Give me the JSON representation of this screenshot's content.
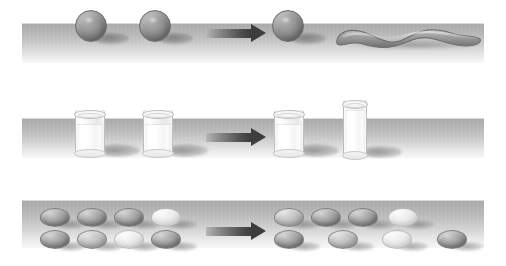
{
  "figure": {
    "background_color": "#ffffff",
    "width": 506,
    "height": 266,
    "table_color_top": "#a9a9a9",
    "table_color_bottom": "#f7f7f7",
    "arrow_color": "#3d3d3d",
    "clay_color": "#8b8b8b",
    "egg_dark_color": "#8d8d8d",
    "egg_mid_color": "#c0c0c0",
    "egg_light_color": "#e6e6e6",
    "milk_color": "#ffffff",
    "glass_outline_color": "#bdbdbd",
    "shadow_color": "#6e6e6e"
  },
  "rows": [
    {
      "id": "row-mass",
      "name": "conservation-of-mass",
      "table": {
        "x": 22,
        "y": 23,
        "w": 462,
        "h": 40
      },
      "arrow": {
        "x": 206,
        "y": 24,
        "shaft_w": 45,
        "label": "transform-arrow"
      },
      "before": {
        "label": "two-equal-clay-balls",
        "objects": [
          {
            "type": "clay-ball",
            "x": 75,
            "y": 10,
            "d": 32
          },
          {
            "type": "clay-ball",
            "x": 139,
            "y": 10,
            "d": 32
          }
        ]
      },
      "after": {
        "label": "ball-and-rolled-snake",
        "objects": [
          {
            "type": "clay-ball",
            "x": 272,
            "y": 10,
            "d": 32
          },
          {
            "type": "clay-snake",
            "x": 335,
            "y": 27,
            "w": 143,
            "h": 21
          }
        ]
      }
    },
    {
      "id": "row-liquid",
      "name": "conservation-of-liquid",
      "table": {
        "x": 22,
        "y": 118,
        "w": 462,
        "h": 40
      },
      "arrow": {
        "x": 206,
        "y": 128,
        "shaft_w": 45,
        "label": "transform-arrow"
      },
      "before": {
        "label": "two-identical-short-glasses",
        "objects": [
          {
            "type": "glass-short",
            "x": 75,
            "y": 110,
            "w": 30,
            "h": 44,
            "fill_pct": 62
          },
          {
            "type": "glass-short",
            "x": 143,
            "y": 110,
            "w": 30,
            "h": 44,
            "fill_pct": 62
          }
        ]
      },
      "after": {
        "label": "short-glass-and-tall-glass",
        "objects": [
          {
            "type": "glass-short",
            "x": 274,
            "y": 110,
            "w": 30,
            "h": 44,
            "fill_pct": 62
          },
          {
            "type": "glass-tall",
            "x": 343,
            "y": 100,
            "w": 24,
            "h": 56,
            "fill_pct": 78
          }
        ]
      }
    },
    {
      "id": "row-number",
      "name": "conservation-of-number",
      "table": {
        "x": 22,
        "y": 200,
        "w": 462,
        "h": 48
      },
      "arrow": {
        "x": 206,
        "y": 222,
        "shaft_w": 45,
        "label": "transform-arrow"
      },
      "before": {
        "label": "two-matched-rows-of-four-eggs",
        "objects": [
          {
            "type": "egg",
            "shade": "dark",
            "x": 40,
            "y": 208,
            "w": 30,
            "h": 19
          },
          {
            "type": "egg",
            "shade": "dark",
            "x": 77,
            "y": 208,
            "w": 30,
            "h": 19
          },
          {
            "type": "egg",
            "shade": "dark",
            "x": 114,
            "y": 208,
            "w": 30,
            "h": 19
          },
          {
            "type": "egg",
            "shade": "light",
            "x": 151,
            "y": 208,
            "w": 30,
            "h": 19
          },
          {
            "type": "egg",
            "shade": "dark",
            "x": 40,
            "y": 230,
            "w": 30,
            "h": 19
          },
          {
            "type": "egg",
            "shade": "mid",
            "x": 77,
            "y": 230,
            "w": 30,
            "h": 19
          },
          {
            "type": "egg",
            "shade": "light",
            "x": 114,
            "y": 230,
            "w": 30,
            "h": 19
          },
          {
            "type": "egg",
            "shade": "dark",
            "x": 151,
            "y": 230,
            "w": 30,
            "h": 19
          }
        ]
      },
      "after": {
        "label": "top-row-of-four-and-spread-bottom-row-of-four",
        "objects": [
          {
            "type": "egg",
            "shade": "mid",
            "x": 274,
            "y": 208,
            "w": 30,
            "h": 19
          },
          {
            "type": "egg",
            "shade": "dark",
            "x": 311,
            "y": 208,
            "w": 30,
            "h": 19
          },
          {
            "type": "egg",
            "shade": "dark",
            "x": 348,
            "y": 208,
            "w": 30,
            "h": 19
          },
          {
            "type": "egg",
            "shade": "light",
            "x": 388,
            "y": 208,
            "w": 30,
            "h": 19
          },
          {
            "type": "egg",
            "shade": "dark",
            "x": 274,
            "y": 230,
            "w": 30,
            "h": 19
          },
          {
            "type": "egg",
            "shade": "mid",
            "x": 328,
            "y": 230,
            "w": 30,
            "h": 19
          },
          {
            "type": "egg",
            "shade": "light",
            "x": 382,
            "y": 230,
            "w": 30,
            "h": 19
          },
          {
            "type": "egg",
            "shade": "dark",
            "x": 437,
            "y": 230,
            "w": 30,
            "h": 19
          }
        ]
      }
    }
  ]
}
